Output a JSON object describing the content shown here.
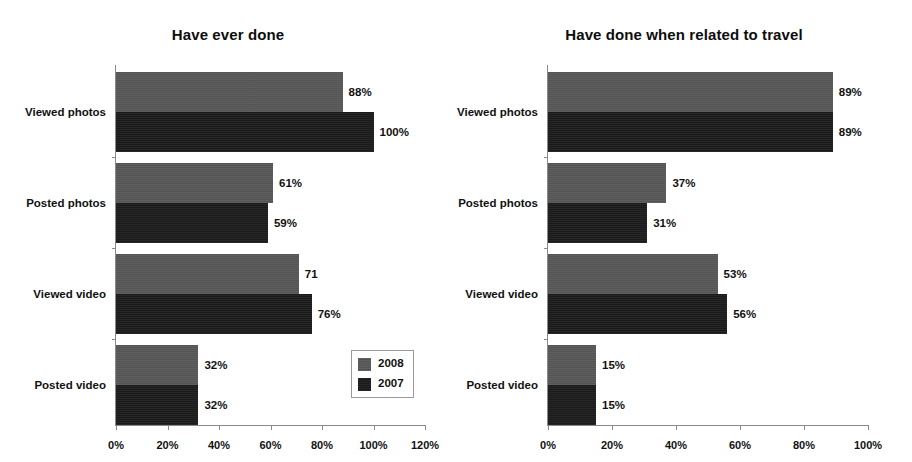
{
  "chart_data": [
    {
      "id": "have-ever-done",
      "type": "bar",
      "orientation": "horizontal",
      "title": "Have ever done",
      "xlabel": "",
      "ylabel": "",
      "xlim": [
        0,
        120
      ],
      "xticks": [
        "0%",
        "20%",
        "40%",
        "60%",
        "80%",
        "100%",
        "120%"
      ],
      "xtick_values": [
        0,
        20,
        40,
        60,
        80,
        100,
        120
      ],
      "grid": false,
      "legend_position": "inside-bottom-right",
      "categories": [
        "Viewed photos",
        "Posted photos",
        "Viewed video",
        "Posted video"
      ],
      "series": [
        {
          "name": "2008",
          "color": "#585858",
          "values": [
            88,
            61,
            71,
            32
          ],
          "labels": [
            "88%",
            "61%",
            "71",
            "32%"
          ]
        },
        {
          "name": "2007",
          "color": "#1b1b1b",
          "values": [
            100,
            59,
            76,
            32
          ],
          "labels": [
            "100%",
            "59%",
            "76%",
            "32%"
          ]
        }
      ]
    },
    {
      "id": "have-done-when-related-to-travel",
      "type": "bar",
      "orientation": "horizontal",
      "title": "Have done when related to travel",
      "xlabel": "",
      "ylabel": "",
      "xlim": [
        0,
        100
      ],
      "xticks": [
        "0%",
        "20%",
        "40%",
        "60%",
        "80%",
        "100%"
      ],
      "xtick_values": [
        0,
        20,
        40,
        60,
        80,
        100
      ],
      "grid": false,
      "legend_position": "inside-bottom-right",
      "categories": [
        "Viewed photos",
        "Posted photos",
        "Viewed video",
        "Posted video"
      ],
      "series": [
        {
          "name": "2008",
          "color": "#585858",
          "values": [
            89,
            37,
            53,
            15
          ],
          "labels": [
            "89%",
            "37%",
            "53%",
            "15%"
          ]
        },
        {
          "name": "2007",
          "color": "#1b1b1b",
          "values": [
            89,
            31,
            56,
            15
          ],
          "labels": [
            "89%",
            "31%",
            "56%",
            "15%"
          ]
        }
      ]
    }
  ]
}
